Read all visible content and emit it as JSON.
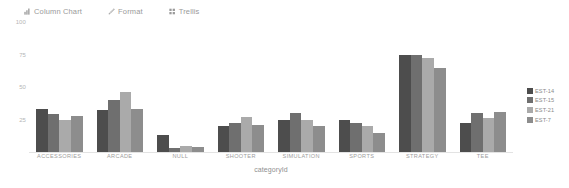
{
  "toolbar": {
    "items": [
      {
        "label": "Column Chart",
        "icon": "column-chart-icon"
      },
      {
        "label": "Format",
        "icon": "pencil-icon"
      },
      {
        "label": "Trellis",
        "icon": "trellis-grid-icon"
      }
    ]
  },
  "legend": {
    "position": "right",
    "entries": [
      {
        "label": "EST-14",
        "color": "#4d4d4d"
      },
      {
        "label": "EST-15",
        "color": "#6f6f6f"
      },
      {
        "label": "EST-21",
        "color": "#aaaaaa"
      },
      {
        "label": "EST-7",
        "color": "#8d8d8d"
      }
    ]
  },
  "axes": {
    "y_ticks": [
      "100",
      "75",
      "50",
      "25"
    ],
    "x_title": "categoryId"
  },
  "chart_data": {
    "type": "bar",
    "title": "",
    "subtitle": "",
    "xlabel": "categoryId",
    "ylabel": "",
    "ylim": [
      0,
      100
    ],
    "y_ticks": [
      100,
      75,
      50,
      25
    ],
    "grid": false,
    "legend_position": "right",
    "categories": [
      "ACCESSORIES",
      "ARCADE",
      "NULL",
      "SHOOTER",
      "SIMULATION",
      "SPORTS",
      "STRATEGY",
      "TEE"
    ],
    "series": [
      {
        "name": "EST-14",
        "color": "#4d4d4d",
        "values": [
          33,
          32,
          13,
          20,
          25,
          25,
          75,
          22
        ]
      },
      {
        "name": "EST-15",
        "color": "#6f6f6f",
        "values": [
          29,
          40,
          3,
          22,
          30,
          22,
          75,
          30
        ]
      },
      {
        "name": "EST-21",
        "color": "#aaaaaa",
        "values": [
          25,
          46,
          5,
          27,
          25,
          20,
          72,
          26
        ]
      },
      {
        "name": "EST-7",
        "color": "#8d8d8d",
        "values": [
          28,
          33,
          4,
          21,
          20,
          15,
          65,
          31
        ]
      }
    ]
  }
}
